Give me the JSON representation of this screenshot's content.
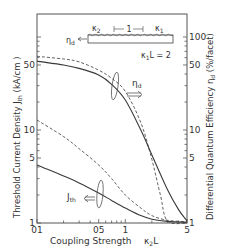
{
  "chart_data": {
    "type": "line",
    "title": "",
    "xlabel": "Coupling Strength",
    "xlabel_symbol": "κ2L",
    "ylabel_left": "Threshold Current Density  Jth (kA/cm )",
    "ylabel_right": "Differential Quantum Efficiency  ηd (%/facet)",
    "x_scale": "log",
    "y_scale": "log",
    "xlim": [
      0.1,
      5
    ],
    "ylim": [
      1,
      177
    ],
    "x_ticks": [
      {
        "value": 0.1,
        "label": "01"
      },
      {
        "value": 0.5,
        "label": "05"
      },
      {
        "value": 1,
        "label": "1"
      },
      {
        "value": 5,
        "label": "5"
      }
    ],
    "y_ticks_left": [
      {
        "value": 1,
        "label": "1"
      },
      {
        "value": 5,
        "label": "5"
      },
      {
        "value": 10,
        "label": "10"
      },
      {
        "value": 50,
        "label": "50"
      }
    ],
    "y_ticks_right": [
      {
        "value": 1,
        "label": "1"
      },
      {
        "value": 5,
        "label": "5"
      },
      {
        "value": 10,
        "label": "10"
      },
      {
        "value": 50,
        "label": "50"
      },
      {
        "value": 100,
        "label": "100"
      }
    ],
    "grid": false,
    "legend": null,
    "series": [
      {
        "name": "ηd (solid)",
        "style": "solid",
        "axis": "right",
        "x": [
          0.1,
          0.2,
          0.3,
          0.5,
          0.7,
          1.0,
          1.5,
          2.0,
          3.0,
          4.0,
          5.0
        ],
        "y": [
          55,
          50,
          46,
          39,
          31,
          21,
          10,
          5.4,
          2.3,
          1.4,
          1.05
        ]
      },
      {
        "name": "ηd (dashed)",
        "style": "dashed",
        "axis": "right",
        "x": [
          0.1,
          0.2,
          0.3,
          0.5,
          0.7,
          1.0,
          1.5,
          2.0,
          2.5,
          3.0,
          5.0
        ],
        "y": [
          62,
          58,
          54,
          44,
          36,
          26,
          12,
          4.8,
          2.0,
          1.05,
          1.0
        ]
      },
      {
        "name": "Jth (solid)",
        "style": "solid",
        "axis": "left",
        "x": [
          0.1,
          0.2,
          0.3,
          0.5,
          0.7,
          1.0,
          1.5,
          2.0,
          3.0,
          5.0
        ],
        "y": [
          4.2,
          3.2,
          2.7,
          2.1,
          1.75,
          1.45,
          1.2,
          1.1,
          1.04,
          1.02
        ]
      },
      {
        "name": "Jth (dashed)",
        "style": "dashed",
        "axis": "left",
        "x": [
          0.1,
          0.2,
          0.3,
          0.5,
          0.7,
          1.0,
          1.5,
          2.0,
          3.0,
          5.0
        ],
        "y": [
          12.8,
          8.5,
          6.3,
          4.2,
          3.0,
          2.0,
          1.45,
          1.2,
          1.07,
          1.03
        ]
      }
    ],
    "annotations": [
      {
        "text": "ηd",
        "note": "arrow pointing right to ηd axis"
      },
      {
        "text": "Jth",
        "note": "arrow pointing left to Jth axis"
      },
      {
        "text": "κ1L = 2"
      },
      {
        "text": "κ2",
        "note": "inset grating section label"
      },
      {
        "text": "κ1",
        "note": "inset grating section label"
      },
      {
        "text": "1",
        "note": "inset section length"
      },
      {
        "text": "ηd",
        "note": "inset output arrow"
      }
    ]
  },
  "labels": {
    "xlabel": "Coupling Strength",
    "xsym_k": "κ",
    "xsym_sub": "2",
    "xsym_L": "L",
    "ylabel_left": "Threshold Current Density  J",
    "ylabel_left_sub": "th",
    "ylabel_left_unit": " (kA/cm  )",
    "ylabel_right": "Differential Quantum Efficiency  η",
    "ylabel_right_sub": "d",
    "ylabel_right_unit": " (%/facet)",
    "eta_label": "η",
    "eta_sub": "d",
    "jth_label": "J",
    "jth_sub": "th",
    "inset_k2": "κ",
    "inset_k2_sub": "2",
    "inset_k1": "κ",
    "inset_k1_sub": "1",
    "inset_len": "1",
    "inset_eta": "η",
    "inset_eta_sub": "d",
    "k1L": "κ",
    "k1L_sub": "1",
    "k1L_rest": "L = 2"
  },
  "colors": {
    "line": "#3a3a3a",
    "axis": "#555555",
    "text": "#333333"
  }
}
